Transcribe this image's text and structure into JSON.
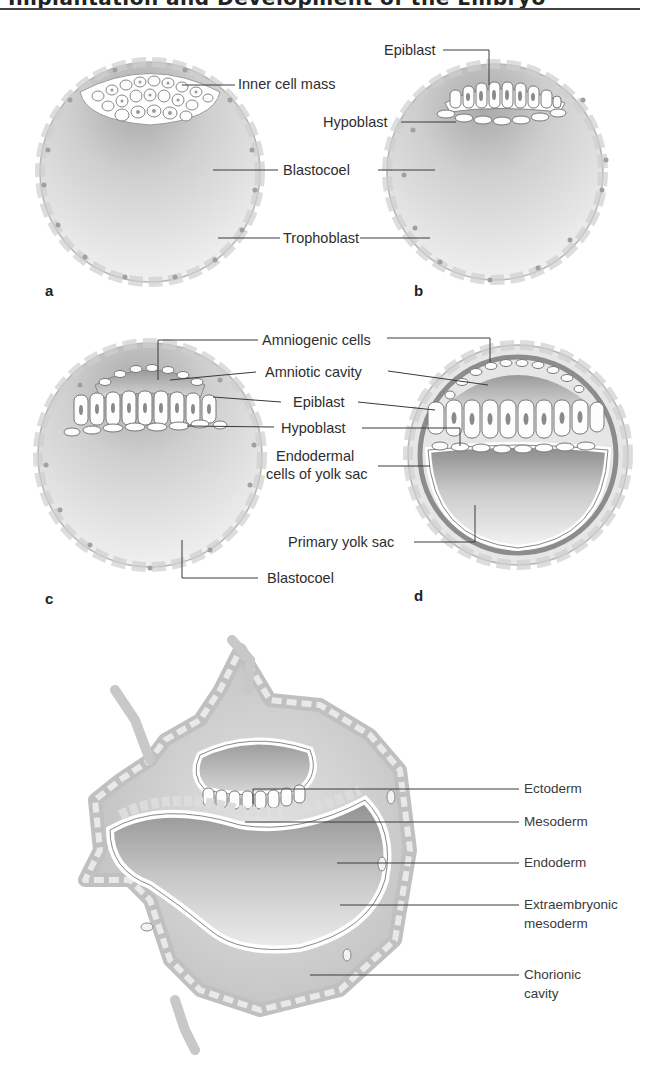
{
  "header": {
    "title_fragment": "Implantation and Development of the Embryo",
    "note": "clipped at top edge"
  },
  "panels": {
    "a": {
      "letter": "a",
      "labels": {
        "inner_cell_mass": "Inner cell mass",
        "blastocoel": "Blastocoel",
        "trophoblast": "Trophoblast"
      }
    },
    "b": {
      "letter": "b",
      "labels": {
        "epiblast": "Epiblast",
        "hypoblast": "Hypoblast"
      }
    },
    "c": {
      "letter": "c",
      "labels": {
        "amniogenic_cells": "Amniogenic cells",
        "amniotic_cavity": "Amniotic cavity",
        "epiblast": "Epiblast",
        "hypoblast": "Hypoblast",
        "blastocoel": "Blastocoel"
      }
    },
    "d": {
      "letter": "d",
      "labels": {
        "endodermal_line1": "Endodermal",
        "endodermal_line2": "cells of yolk sac",
        "primary_yolk_sac": "Primary yolk sac"
      }
    },
    "e": {
      "labels": {
        "ectoderm": "Ectoderm",
        "mesoderm": "Mesoderm",
        "endoderm": "Endoderm",
        "extraembryonic_line1": "Extraembryonic",
        "extraembryonic_line2": "mesoderm",
        "chorionic_line1": "Chorionic",
        "chorionic_line2": "cavity"
      }
    }
  },
  "colors": {
    "line": "#3a3a3a",
    "shade_dark": "#9a9a9a",
    "shade_light": "#efefef",
    "cell_fill": "#fbfbfb",
    "nucleus": "#9c9c9c"
  }
}
